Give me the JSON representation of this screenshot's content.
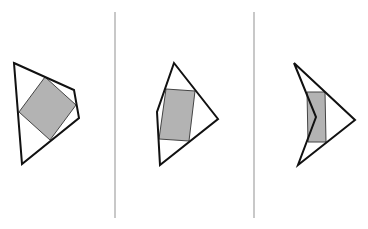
{
  "figure": {
    "panel_count": 3,
    "colors": {
      "outline": "#111111",
      "fill": "#b3b3b3",
      "fill_stroke": "#333333",
      "divider": "#c8c8c8",
      "background": "#ffffff"
    },
    "panels": [
      {
        "name": "panel-1",
        "inscribed_shape": "square (rotated)"
      },
      {
        "name": "panel-2",
        "inscribed_shape": "rectangle"
      },
      {
        "name": "panel-3",
        "inscribed_shape": "rectangle"
      }
    ]
  }
}
